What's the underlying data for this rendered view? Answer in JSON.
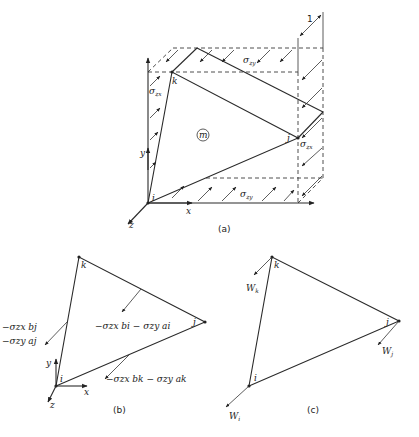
{
  "figure_a": {
    "caption": "(a)",
    "element_label": "m",
    "nodes": {
      "i": "i",
      "j": "j",
      "k": "k"
    },
    "axes": {
      "x": "x",
      "y": "y",
      "z": "z"
    },
    "stress_labels": {
      "top": "σ",
      "top_sub": "zy",
      "bottom": "σ",
      "bottom_sub": "zy",
      "left": "σ",
      "left_sub": "zx",
      "right": "σ",
      "right_sub": "zx"
    },
    "thickness_label": "1"
  },
  "figure_b": {
    "caption": "(b)",
    "nodes": {
      "i": "i",
      "j": "j",
      "k": "k"
    },
    "axes": {
      "x": "x",
      "y": "y",
      "z": "z"
    },
    "loads": {
      "edge_kj": "−σzx bi − σzy ai",
      "edge_ik_line1": "−σzx bj",
      "edge_ik_line2": "−σzy aj",
      "edge_ij": "−σzx bk − σzy ak"
    }
  },
  "figure_c": {
    "caption": "(c)",
    "nodes": {
      "i": "i",
      "j": "j",
      "k": "k"
    },
    "forces": {
      "k": "W",
      "k_sub": "k",
      "j": "W",
      "j_sub": "j",
      "i": "W",
      "i_sub": "i"
    }
  }
}
